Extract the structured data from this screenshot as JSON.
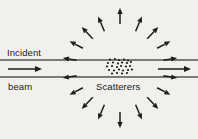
{
  "figure": {
    "name": "scattering-diagram",
    "width": 198,
    "height": 139,
    "background_color": "#f1f0ed",
    "ink_color": "#1d1d1d",
    "beam_line_color": "#555555"
  },
  "labels": {
    "incident": "Incident",
    "beam": "beam",
    "scatterers": "Scatterers"
  },
  "beam": {
    "top_line_y": 60,
    "bottom_line_y": 77,
    "line_x_start": 0,
    "line_x_end": 198,
    "center_y": 68.5,
    "incident_arrow": {
      "x1": 8,
      "y1": 69,
      "x2": 42,
      "y2": 69
    },
    "outgoing_arrow": {
      "x1": 158,
      "y1": 69,
      "x2": 191,
      "y2": 69
    }
  },
  "scatterers": {
    "center_x": 120,
    "center_y": 67,
    "dot_radius": 1.1,
    "dots": [
      [
        110,
        59.5
      ],
      [
        115,
        59.0
      ],
      [
        119,
        60.0
      ],
      [
        124,
        59.5
      ],
      [
        128,
        60.5
      ],
      [
        108,
        63.0
      ],
      [
        113,
        62.5
      ],
      [
        118,
        63.5
      ],
      [
        122,
        62.5
      ],
      [
        127,
        63.0
      ],
      [
        131,
        62.0
      ],
      [
        107,
        66.5
      ],
      [
        112,
        66.0
      ],
      [
        117,
        67.0
      ],
      [
        121,
        66.0
      ],
      [
        126,
        66.5
      ],
      [
        130,
        66.0
      ],
      [
        109,
        70.0
      ],
      [
        114,
        70.5
      ],
      [
        119,
        69.5
      ],
      [
        123,
        70.5
      ],
      [
        128,
        70.0
      ],
      [
        132,
        69.5
      ],
      [
        112,
        73.5
      ],
      [
        117,
        73.0
      ],
      [
        122,
        73.5
      ],
      [
        127,
        73.0
      ]
    ]
  },
  "scattered_arrows": {
    "description": "Arrows radiating outward from the scatterer cluster",
    "count": 16,
    "origin_x": 120,
    "origin_y": 68,
    "items": [
      {
        "angle_deg": 170,
        "inner_r": 44,
        "outer_r": 58
      },
      {
        "angle_deg": 152,
        "inner_r": 42,
        "outer_r": 57
      },
      {
        "angle_deg": 133,
        "inner_r": 40,
        "outer_r": 56
      },
      {
        "angle_deg": 113,
        "inner_r": 40,
        "outer_r": 56
      },
      {
        "angle_deg": 90,
        "inner_r": 44,
        "outer_r": 60
      },
      {
        "angle_deg": 67,
        "inner_r": 40,
        "outer_r": 56
      },
      {
        "angle_deg": 47,
        "inner_r": 40,
        "outer_r": 56
      },
      {
        "angle_deg": 28,
        "inner_r": 42,
        "outer_r": 57
      },
      {
        "angle_deg": 10,
        "inner_r": 44,
        "outer_r": 58
      },
      {
        "angle_deg": -10,
        "inner_r": 44,
        "outer_r": 58
      },
      {
        "angle_deg": -28,
        "inner_r": 42,
        "outer_r": 57
      },
      {
        "angle_deg": -47,
        "inner_r": 40,
        "outer_r": 56
      },
      {
        "angle_deg": -67,
        "inner_r": 40,
        "outer_r": 56
      },
      {
        "angle_deg": -90,
        "inner_r": 44,
        "outer_r": 60
      },
      {
        "angle_deg": -113,
        "inner_r": 40,
        "outer_r": 56
      },
      {
        "angle_deg": -133,
        "inner_r": 40,
        "outer_r": 56
      },
      {
        "angle_deg": -152,
        "inner_r": 42,
        "outer_r": 57
      },
      {
        "angle_deg": -170,
        "inner_r": 44,
        "outer_r": 58
      }
    ]
  }
}
